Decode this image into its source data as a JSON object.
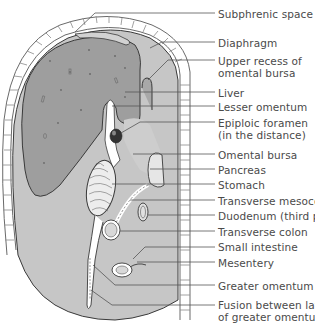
{
  "figure": {
    "type": "anatomical sagittal section",
    "colors": {
      "liver": "#9e9e9e",
      "peritoneal_cavity": "#c6c6c6",
      "organ_light": "#e6e6e6",
      "outline": "#3a3a3a",
      "leader_line": "#555555",
      "text": "#4a4a4a"
    }
  },
  "labels": [
    {
      "id": "subphrenic-space",
      "lines": [
        "Subphrenic space"
      ],
      "y": 8
    },
    {
      "id": "diaphragm",
      "lines": [
        "Diaphragm"
      ],
      "y": 38
    },
    {
      "id": "upper-recess",
      "lines": [
        "Upper recess of",
        "omental bursa"
      ],
      "y": 55
    },
    {
      "id": "liver",
      "lines": [
        "Liver"
      ],
      "y": 87
    },
    {
      "id": "lesser-omentum",
      "lines": [
        "Lesser omentum"
      ],
      "y": 101
    },
    {
      "id": "epiploic-foramen",
      "lines": [
        "Epiploic foramen",
        "(in the distance)"
      ],
      "y": 117
    },
    {
      "id": "omental-bursa",
      "lines": [
        "Omental bursa"
      ],
      "y": 149
    },
    {
      "id": "pancreas",
      "lines": [
        "Pancreas"
      ],
      "y": 164
    },
    {
      "id": "stomach",
      "lines": [
        "Stomach"
      ],
      "y": 179
    },
    {
      "id": "transverse-mesocolon",
      "lines": [
        "Transverse mesocolon"
      ],
      "y": 195
    },
    {
      "id": "duodenum",
      "lines": [
        "Duodenum (third part)"
      ],
      "y": 210
    },
    {
      "id": "transverse-colon",
      "lines": [
        "Transverse colon"
      ],
      "y": 226
    },
    {
      "id": "small-intestine",
      "lines": [
        "Small intestine"
      ],
      "y": 241
    },
    {
      "id": "mesentery",
      "lines": [
        "Mesentery"
      ],
      "y": 257
    },
    {
      "id": "greater-omentum",
      "lines": [
        "Greater omentum"
      ],
      "y": 280
    },
    {
      "id": "fusion",
      "lines": [
        "Fusion between layers",
        "of greater omentum"
      ],
      "y": 296
    }
  ]
}
